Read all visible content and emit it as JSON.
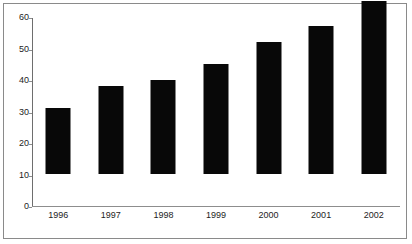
{
  "chart_data": {
    "type": "bar",
    "title": "",
    "subtitle": "",
    "xlabel": "",
    "ylabel": "",
    "categories": [
      "1996",
      "1997",
      "1998",
      "1999",
      "2000",
      "2001",
      "2002"
    ],
    "values": [
      21,
      28,
      30,
      35,
      42,
      47,
      55
    ],
    "ylim": [
      0,
      60
    ],
    "yticks": [
      0,
      10,
      20,
      30,
      40,
      50,
      60
    ],
    "ytick_labels": [
      "0",
      "10",
      "20",
      "30",
      "40",
      "50",
      "60"
    ],
    "grid": false,
    "legend": null,
    "legend_position": "none",
    "bar_color": "#080808",
    "axis_color": "#8d8d8d",
    "text_color": "#1d1d1d",
    "background_color": "#ffffff",
    "border_color": "#8a8a8a",
    "annotations": []
  }
}
